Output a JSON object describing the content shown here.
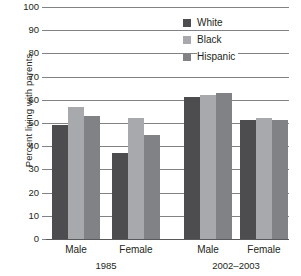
{
  "chart_data": {
    "type": "bar",
    "title": "",
    "xlabel": "",
    "ylabel": "Percent living with parents",
    "ylim": [
      0,
      100
    ],
    "ytick_labels": [
      "100",
      "90",
      "80",
      "70",
      "60",
      "50",
      "40",
      "30",
      "20",
      "10",
      "0"
    ],
    "ytick_values": [
      100,
      90,
      80,
      70,
      60,
      50,
      40,
      30,
      20,
      10,
      0
    ],
    "grid": true,
    "legend_position": "top-right",
    "categories": [
      "Male",
      "Female",
      "Male",
      "Female"
    ],
    "group_labels": [
      "1985",
      "2002–2003"
    ],
    "series": [
      {
        "name": "White",
        "color": "#4d4d4f",
        "values": [
          49,
          37,
          61,
          51.5
        ]
      },
      {
        "name": "Black",
        "color": "#a7a9ac",
        "values": [
          57,
          52,
          62,
          52
        ]
      },
      {
        "name": "Hispanic",
        "color": "#808285",
        "values": [
          53,
          45,
          63,
          51.5
        ]
      }
    ]
  },
  "axis": {
    "y_title": "Percent living with parents"
  },
  "legend": {
    "items": [
      {
        "label": "White",
        "swatch": "white"
      },
      {
        "label": "Black",
        "swatch": "black"
      },
      {
        "label": "Hispanic",
        "swatch": "hispanic"
      }
    ]
  },
  "x_axis": {
    "group_ticks": [
      {
        "label": "Male"
      },
      {
        "label": "Female"
      },
      {
        "label": "Male"
      },
      {
        "label": "Female"
      }
    ],
    "periods": [
      {
        "label": "1985"
      },
      {
        "label": "2002–2003"
      }
    ]
  }
}
